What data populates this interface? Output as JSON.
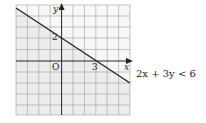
{
  "diagram": {
    "type": "linear-inequality-graph",
    "inequality": "2x + 3y < 6",
    "boundary_line": {
      "x_intercept": 3,
      "y_intercept": 2,
      "style": "solid"
    },
    "shaded_region": "below line",
    "axes": {
      "x_label": "x",
      "y_label": "y",
      "origin_label": "O"
    },
    "intercept_labels": {
      "x": "3",
      "y": "2"
    },
    "grid": {
      "columns": 10,
      "rows": 10
    },
    "colors": {
      "shade": "#ececec",
      "grid": "#9a9a9a",
      "line": "#222222",
      "background": "#ffffff"
    }
  }
}
